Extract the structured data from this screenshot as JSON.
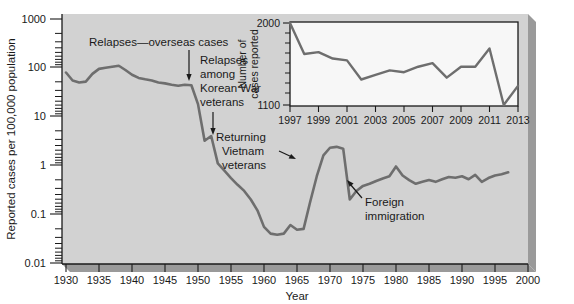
{
  "figure": {
    "plot_bg_color": "#d2d2d2",
    "line_color": "#6e6e6e",
    "axis_color": "#1a1a1a",
    "inset_bg_color": "#f7f7f7"
  },
  "main": {
    "ylabel": "Reported cases per 100,000 population",
    "xlabel": "Year",
    "ytick_labels": [
      "1000",
      "100",
      "10",
      "1",
      "0.1",
      "0.01"
    ],
    "xtick_labels": [
      "1930",
      "1935",
      "1940",
      "1945",
      "1950",
      "1955",
      "1960",
      "1965",
      "1970",
      "1975",
      "1980",
      "1985",
      "1990",
      "1995",
      "2000"
    ],
    "annotations": [
      {
        "name": "relapses-overseas-cases",
        "text": "Relapses—overseas cases"
      },
      {
        "name": "relapses-korean-war",
        "line1": "Relapses",
        "line2": "among",
        "line3": "Korean War",
        "line4": "veterans"
      },
      {
        "name": "returning-vietnam-veterans",
        "line1": "Returning",
        "line2": "Vietnam",
        "line3": "veterans"
      },
      {
        "name": "foreign-immigration",
        "line1": "Foreign",
        "line2": "immigration"
      }
    ]
  },
  "inset": {
    "ylabel_line1": "Number of",
    "ylabel_line2": "cases reported",
    "ytick_labels": [
      "2000",
      "1100"
    ],
    "xtick_labels": [
      "1997",
      "1999",
      "2001",
      "2003",
      "2005",
      "2007",
      "2009",
      "2011",
      "2013"
    ]
  },
  "chart_data": [
    {
      "type": "line",
      "id": "main-chart",
      "title": "",
      "xlabel": "Year",
      "ylabel": "Reported cases per 100,000 population",
      "yscale": "log",
      "ylim": [
        0.01,
        1000
      ],
      "xlim": [
        1930,
        2000
      ],
      "grid": false,
      "legend": null,
      "ytick_values": [
        1000,
        100,
        10,
        1,
        0.1,
        0.01
      ],
      "xtick_values": [
        1930,
        1935,
        1940,
        1945,
        1950,
        1955,
        1960,
        1965,
        1970,
        1975,
        1980,
        1985,
        1990,
        1995,
        2000
      ],
      "x": [
        1930,
        1931,
        1932,
        1933,
        1934,
        1935,
        1936,
        1937,
        1938,
        1939,
        1940,
        1941,
        1942,
        1943,
        1944,
        1945,
        1946,
        1947,
        1948,
        1949,
        1950,
        1951,
        1952,
        1953,
        1954,
        1955,
        1956,
        1957,
        1958,
        1959,
        1960,
        1961,
        1962,
        1963,
        1964,
        1965,
        1966,
        1967,
        1968,
        1969,
        1970,
        1971,
        1972,
        1973,
        1974,
        1975,
        1976,
        1977,
        1978,
        1979,
        1980,
        1981,
        1982,
        1983,
        1984,
        1985,
        1986,
        1987,
        1988,
        1989,
        1990,
        1991,
        1992,
        1993,
        1994,
        1995,
        1996,
        1997
      ],
      "values": [
        80,
        55,
        50,
        52,
        75,
        95,
        100,
        105,
        110,
        90,
        72,
        62,
        58,
        55,
        50,
        48,
        45,
        43,
        45,
        44,
        18,
        3.2,
        4.0,
        1.1,
        0.78,
        0.55,
        0.4,
        0.3,
        0.2,
        0.12,
        0.055,
        0.04,
        0.038,
        0.04,
        0.06,
        0.048,
        0.05,
        0.18,
        0.6,
        1.6,
        2.3,
        2.4,
        2.2,
        0.2,
        0.3,
        0.38,
        0.42,
        0.48,
        0.54,
        0.6,
        0.95,
        0.62,
        0.5,
        0.42,
        0.46,
        0.5,
        0.46,
        0.52,
        0.58,
        0.56,
        0.6,
        0.52,
        0.64,
        0.46,
        0.55,
        0.62,
        0.66,
        0.72
      ],
      "annotations": [
        {
          "text": "Relapses—overseas cases",
          "points_to_x": 1949,
          "points_to_y": 45
        },
        {
          "text": "Relapses among Korean War veterans",
          "points_to_x": 1952,
          "points_to_y": 4.0
        },
        {
          "text": "Returning Vietnam veterans",
          "points_to_x": 1969,
          "points_to_y": 1.9
        },
        {
          "text": "Foreign immigration",
          "points_to_x": 1979,
          "points_to_y": 0.6
        }
      ]
    },
    {
      "type": "line",
      "id": "inset-chart",
      "title": "",
      "xlabel": "",
      "ylabel": "Number of cases reported",
      "yscale": "linear",
      "ylim": [
        1100,
        2000
      ],
      "xlim": [
        1997,
        2013
      ],
      "grid": false,
      "legend": null,
      "ytick_values": [
        1100,
        2000
      ],
      "xtick_values": [
        1997,
        1999,
        2001,
        2003,
        2005,
        2007,
        2009,
        2011,
        2013
      ],
      "x": [
        1997,
        1998,
        1999,
        2000,
        2001,
        2002,
        2003,
        2004,
        2005,
        2006,
        2007,
        2008,
        2009,
        2010,
        2011,
        2012,
        2013
      ],
      "values": [
        2000,
        1660,
        1680,
        1610,
        1590,
        1380,
        1430,
        1480,
        1460,
        1520,
        1560,
        1400,
        1520,
        1520,
        1720,
        1100,
        1310
      ]
    }
  ]
}
